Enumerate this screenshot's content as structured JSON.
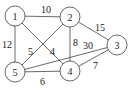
{
  "graph": {
    "nodes": [
      {
        "id": "1",
        "label": "1",
        "x": 15,
        "y": 16
      },
      {
        "id": "2",
        "label": "2",
        "x": 70,
        "y": 17
      },
      {
        "id": "3",
        "label": "3",
        "x": 117,
        "y": 45
      },
      {
        "id": "4",
        "label": "4",
        "x": 70,
        "y": 71
      },
      {
        "id": "5",
        "label": "5",
        "x": 15,
        "y": 72
      }
    ],
    "edges": [
      {
        "from": "1",
        "to": "2",
        "weight": "10",
        "lx": 41,
        "ly": 13
      },
      {
        "from": "1",
        "to": "5",
        "weight": "12",
        "lx": 2,
        "ly": 48
      },
      {
        "from": "1",
        "to": "4",
        "weight": "4",
        "lx": 50,
        "ly": 55
      },
      {
        "from": "2",
        "to": "5",
        "weight": "5",
        "lx": 28,
        "ly": 55
      },
      {
        "from": "2",
        "to": "4",
        "weight": "8",
        "lx": 73,
        "ly": 46
      },
      {
        "from": "2",
        "to": "3",
        "weight": "15",
        "lx": 95,
        "ly": 31
      },
      {
        "from": "5",
        "to": "3",
        "weight": "30",
        "lx": 83,
        "ly": 49
      },
      {
        "from": "5",
        "to": "4",
        "weight": "6",
        "lx": 40,
        "ly": 85
      },
      {
        "from": "4",
        "to": "3",
        "weight": "7",
        "lx": 93,
        "ly": 69
      }
    ],
    "node_radius": 10
  }
}
